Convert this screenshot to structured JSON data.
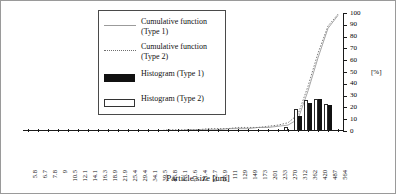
{
  "figure": {
    "xaxis_title": "Particle size [um]",
    "yaxis_unit": "[%]"
  },
  "legend": {
    "items": [
      {
        "label": "Cumulative function\n(Type 1)",
        "key": "solid-line-key"
      },
      {
        "label": "Cumulative function\n(Type 2)",
        "key": "dotted-line-key"
      },
      {
        "label": "Histogram (Type 1)",
        "key": "black-box-key"
      },
      {
        "label": "Histogram (Type 2)",
        "key": "white-box-key"
      }
    ]
  },
  "chart_data": {
    "type": "bar",
    "title": "",
    "xlabel": "Particle size [um]",
    "ylabel": "[%]",
    "ylim": [
      0,
      100
    ],
    "yticks": [
      0,
      10,
      20,
      30,
      40,
      50,
      60,
      70,
      80,
      90,
      100
    ],
    "grid": false,
    "legend_position": "top-center",
    "categories": [
      "5.8",
      "6.7",
      "7.8",
      "9",
      "10.5",
      "12.1",
      "14.1",
      "16.3",
      "18.9",
      "21.9",
      "25.4",
      "29.4",
      "34.1",
      "39.5",
      "45.8",
      "53.1",
      "61.6",
      "71.4",
      "82.7",
      "95.9",
      "111",
      "129",
      "149",
      "173",
      "201",
      "233",
      "270",
      "312",
      "362",
      "420",
      "487",
      "564"
    ],
    "series": [
      {
        "name": "Histogram (Type 1)",
        "type": "bar",
        "values": [
          0,
          0,
          0,
          0,
          0,
          0,
          0,
          0,
          0,
          0,
          0,
          0,
          0,
          0,
          0,
          0,
          0,
          0,
          0,
          0,
          0,
          0,
          0,
          0,
          0,
          0,
          0,
          13,
          24,
          27,
          22,
          0
        ]
      },
      {
        "name": "Histogram (Type 2)",
        "type": "bar",
        "values": [
          0,
          0,
          0,
          0,
          0,
          0,
          0,
          0,
          0,
          0,
          0,
          0,
          0,
          0,
          0,
          0,
          0,
          0,
          0,
          0,
          0,
          0,
          0,
          0,
          0,
          0,
          3,
          19,
          26,
          27,
          23,
          0
        ]
      },
      {
        "name": "Cumulative function (Type 1)",
        "type": "line",
        "values": [
          0,
          0,
          0,
          0,
          0,
          0,
          0,
          0,
          0,
          0,
          0,
          0,
          0,
          0,
          0,
          0,
          1,
          1,
          1,
          1,
          2,
          2,
          2,
          3,
          3,
          4,
          5,
          10,
          34,
          62,
          87,
          98
        ]
      },
      {
        "name": "Cumulative function (Type 2)",
        "type": "line",
        "values": [
          0,
          0,
          0,
          0,
          0,
          0,
          0,
          0,
          0,
          0,
          0,
          0,
          0,
          0,
          1,
          1,
          1,
          1,
          2,
          2,
          2,
          3,
          3,
          3,
          4,
          5,
          7,
          14,
          38,
          66,
          89,
          99
        ]
      }
    ]
  }
}
